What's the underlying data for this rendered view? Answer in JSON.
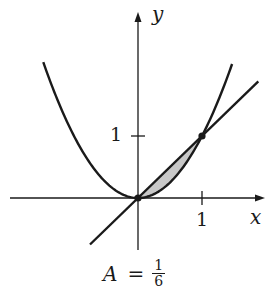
{
  "chart_data": {
    "type": "line",
    "title": "",
    "xlabel": "x",
    "ylabel": "y",
    "xlim": [
      -2.0,
      1.95
    ],
    "ylim": [
      -0.85,
      3.0
    ],
    "grid": false,
    "legend": null,
    "x_ticks": [
      {
        "value": 1,
        "label": "1"
      }
    ],
    "y_ticks": [
      {
        "value": 1,
        "label": "1"
      }
    ],
    "series": [
      {
        "name": "parabola",
        "equation": "y = x^2",
        "x_range": [
          -1.48,
          1.47
        ],
        "x": [
          -1.48,
          -1.0,
          -0.5,
          0,
          0.5,
          1.0,
          1.47
        ],
        "y": [
          2.19,
          1.0,
          0.25,
          0,
          0.25,
          1.0,
          2.16
        ]
      },
      {
        "name": "line",
        "equation": "y = x",
        "x_range": [
          -0.75,
          1.88
        ],
        "x": [
          -0.75,
          0,
          1,
          1.88
        ],
        "y": [
          -0.75,
          0,
          1,
          1.88
        ]
      }
    ],
    "shaded_region": {
      "between": [
        "y = x",
        "y = x^2"
      ],
      "x_range": [
        0,
        1
      ],
      "color": "#c8c8c8"
    },
    "intersection_points": [
      {
        "x": 0,
        "y": 0
      },
      {
        "x": 1,
        "y": 1
      }
    ],
    "annotations": [
      {
        "text": "A = 1/6",
        "meaning": "area of shaded region"
      }
    ]
  },
  "labels": {
    "x_axis": "x",
    "y_axis": "y",
    "x_tick_1": "1",
    "y_tick_1": "1",
    "area_var": "A",
    "area_equals": "=",
    "area_num": "1",
    "area_den": "6"
  },
  "colors": {
    "ink": "#1a1a1a",
    "shade": "#c8c8c8",
    "background": "#ffffff"
  }
}
